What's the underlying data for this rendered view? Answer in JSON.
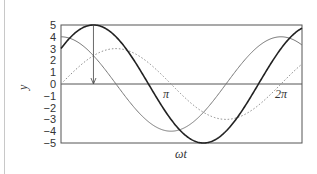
{
  "chart_data": {
    "type": "line",
    "title": "",
    "xlabel": "ωt",
    "ylabel": "y",
    "ylim": [
      -5,
      5
    ],
    "xlim_rad": [
      0,
      6.88
    ],
    "yticks": [
      "5",
      "4",
      "3",
      "2",
      "1",
      "0",
      "−1",
      "−2",
      "−3",
      "−4",
      "−5"
    ],
    "x_annotations": [
      {
        "label": "π",
        "value_rad": 3.14159
      },
      {
        "label": "2π",
        "value_rad": 6.28318
      }
    ],
    "grid": false,
    "legend": null,
    "series": [
      {
        "name": "resultant (5 sin(ωt + 36.87°))",
        "style": "solid-thick-black",
        "amplitude": 5,
        "phase_rad": 0.6435,
        "y_at_0": 3
      },
      {
        "name": "4 cos(ωt)",
        "style": "solid-thin-gray",
        "amplitude": 4,
        "phase_rad": 1.5708,
        "y_at_0": 4
      },
      {
        "name": "3 sin(ωt)",
        "style": "dotted-gray",
        "amplitude": 3,
        "phase_rad": 0,
        "y_at_0": 0
      }
    ],
    "annotations": [
      {
        "type": "arrow",
        "from": {
          "x_rad": 0.927,
          "y": 5
        },
        "to": {
          "x_rad": 0.927,
          "y": 0
        },
        "note": "peak of resultant"
      }
    ]
  },
  "labels": {
    "ylabel": "y",
    "xlabel": "ωt",
    "pi": "π",
    "two_pi": "2π"
  }
}
